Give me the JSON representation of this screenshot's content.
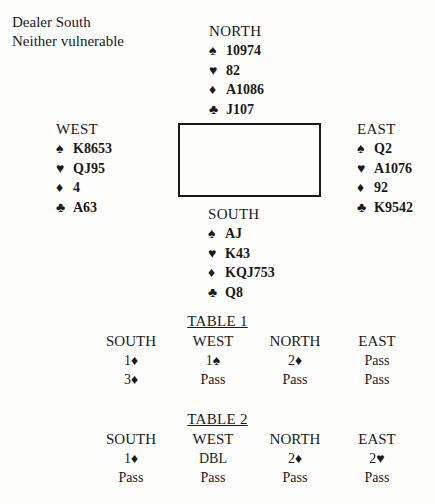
{
  "meta": {
    "dealer": "Dealer South",
    "vulnerability": "Neither vulnerable"
  },
  "suit_symbols": {
    "spades": "♠",
    "hearts": "♥",
    "diamonds": "♦",
    "clubs": "♣"
  },
  "hands": {
    "north": {
      "label": "NORTH",
      "spades": "10974",
      "hearts": "82",
      "diamonds": "A1086",
      "clubs": "J107"
    },
    "west": {
      "label": "WEST",
      "spades": "K8653",
      "hearts": "QJ95",
      "diamonds": "4",
      "clubs": "A63"
    },
    "east": {
      "label": "EAST",
      "spades": "Q2",
      "hearts": "A1076",
      "diamonds": "92",
      "clubs": "K9542"
    },
    "south": {
      "label": "SOUTH",
      "spades": "AJ",
      "hearts": "K43",
      "diamonds": "KQJ753",
      "clubs": "Q8"
    }
  },
  "auctions": [
    {
      "title": "TABLE 1",
      "headers": [
        "SOUTH",
        "WEST",
        "NORTH",
        "EAST"
      ],
      "rows": [
        [
          "1♦",
          "1♠",
          "2♦",
          "Pass"
        ],
        [
          "3♦",
          "Pass",
          "Pass",
          "Pass"
        ]
      ]
    },
    {
      "title": "TABLE 2",
      "headers": [
        "SOUTH",
        "WEST",
        "NORTH",
        "EAST"
      ],
      "rows": [
        [
          "1♦",
          "DBL",
          "2♦",
          "2♥"
        ],
        [
          "Pass",
          "Pass",
          "Pass",
          "Pass"
        ]
      ]
    }
  ]
}
